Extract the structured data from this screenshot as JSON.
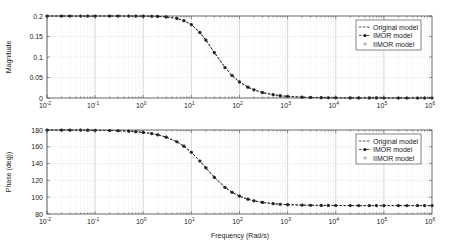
{
  "chart_data": [
    {
      "type": "line",
      "title": "",
      "xlabel": "",
      "ylabel": "Magnitude",
      "xscale": "log",
      "xlim": [
        0.01,
        1000000
      ],
      "ylim": [
        0,
        0.2
      ],
      "xticks": [
        0.01,
        0.1,
        1,
        10,
        100,
        1000,
        10000,
        100000,
        1000000
      ],
      "xtick_labels": [
        {
          "base": "10",
          "exp": "-2"
        },
        {
          "base": "10",
          "exp": "-1"
        },
        {
          "base": "10",
          "exp": "0"
        },
        {
          "base": "10",
          "exp": "1"
        },
        {
          "base": "10",
          "exp": "2"
        },
        {
          "base": "10",
          "exp": "3"
        },
        {
          "base": "10",
          "exp": "4"
        },
        {
          "base": "10",
          "exp": "5"
        },
        {
          "base": "10",
          "exp": "6"
        }
      ],
      "yticks": [
        0,
        0.05,
        0.1,
        0.15,
        0.2
      ],
      "ytick_labels": [
        "0",
        "0.05",
        "0.1",
        "0.15",
        "0.2"
      ],
      "grid": true,
      "legend_position": "top-right",
      "legend": [
        "Original model",
        "IMOR model",
        "IIMOR model"
      ],
      "x": [
        0.01,
        0.02,
        0.03,
        0.05,
        0.07,
        0.1,
        0.2,
        0.3,
        0.5,
        0.7,
        1,
        1.5,
        2,
        3,
        5,
        7,
        10,
        15,
        20,
        30,
        50,
        70,
        100,
        150,
        200,
        300,
        500,
        700,
        1000,
        2000,
        3000,
        5000,
        7000,
        10000,
        20000,
        30000,
        50000,
        70000,
        100000,
        200000,
        300000,
        500000,
        700000,
        1000000
      ],
      "series": [
        {
          "name": "Original model",
          "style": "dashed",
          "values": [
            0.2,
            0.2,
            0.2,
            0.2,
            0.2,
            0.2,
            0.2,
            0.2,
            0.2,
            0.2,
            0.1998,
            0.1994,
            0.199,
            0.1978,
            0.194,
            0.1887,
            0.1789,
            0.16,
            0.1414,
            0.1109,
            0.0743,
            0.0549,
            0.0392,
            0.0264,
            0.0199,
            0.0133,
            0.008,
            0.0057,
            0.004,
            0.002,
            0.0013,
            0.0008,
            0.0006,
            0.0004,
            0.0002,
            0.0001,
            0.0001,
            0.0001,
            0.0,
            0.0,
            0.0,
            0.0,
            0.0,
            0.0
          ]
        },
        {
          "name": "IMOR model",
          "style": "dashed-star",
          "values": [
            0.2,
            0.2,
            0.2,
            0.2,
            0.2,
            0.2,
            0.2,
            0.2,
            0.2,
            0.2,
            0.1998,
            0.1994,
            0.199,
            0.1978,
            0.194,
            0.1887,
            0.1789,
            0.16,
            0.1414,
            0.1109,
            0.0743,
            0.0549,
            0.0392,
            0.0264,
            0.0199,
            0.0133,
            0.008,
            0.0057,
            0.004,
            0.002,
            0.0013,
            0.0008,
            0.0006,
            0.0004,
            0.0002,
            0.0001,
            0.0001,
            0.0001,
            0.0,
            0.0,
            0.0,
            0.0,
            0.0,
            0.0
          ]
        },
        {
          "name": "IIMOR model",
          "style": "circle",
          "values": [
            0.2,
            0.2,
            0.2,
            0.2,
            0.2,
            0.2,
            0.2,
            0.2,
            0.2,
            0.2,
            0.1998,
            0.1994,
            0.199,
            0.1978,
            0.194,
            0.1887,
            0.1789,
            0.16,
            0.1414,
            0.1109,
            0.0743,
            0.0549,
            0.0392,
            0.0264,
            0.0199,
            0.0133,
            0.008,
            0.0057,
            0.004,
            0.002,
            0.0013,
            0.0008,
            0.0006,
            0.0004,
            0.0002,
            0.0001,
            0.0001,
            0.0001,
            0.0,
            0.0,
            0.0,
            0.0,
            0.0,
            0.0
          ]
        }
      ]
    },
    {
      "type": "line",
      "title": "",
      "xlabel": "Frequency (Rad/s)",
      "ylabel": "Phase (deg))",
      "xscale": "log",
      "xlim": [
        0.01,
        1000000
      ],
      "ylim": [
        80,
        180
      ],
      "xticks": [
        0.01,
        0.1,
        1,
        10,
        100,
        1000,
        10000,
        100000,
        1000000
      ],
      "xtick_labels": [
        {
          "base": "10",
          "exp": "-2"
        },
        {
          "base": "10",
          "exp": "-1"
        },
        {
          "base": "10",
          "exp": "0"
        },
        {
          "base": "10",
          "exp": "1"
        },
        {
          "base": "10",
          "exp": "2"
        },
        {
          "base": "10",
          "exp": "3"
        },
        {
          "base": "10",
          "exp": "4"
        },
        {
          "base": "10",
          "exp": "5"
        },
        {
          "base": "10",
          "exp": "6"
        }
      ],
      "yticks": [
        80,
        100,
        120,
        140,
        160,
        180
      ],
      "ytick_labels": [
        "80",
        "100",
        "120",
        "140",
        "160",
        "180"
      ],
      "grid": true,
      "legend_position": "top-right",
      "legend": [
        "Original model",
        "IMOR model",
        "IIMOR model"
      ],
      "x": [
        0.01,
        0.02,
        0.03,
        0.05,
        0.07,
        0.1,
        0.2,
        0.3,
        0.5,
        0.7,
        1,
        1.5,
        2,
        3,
        5,
        7,
        10,
        15,
        20,
        30,
        50,
        70,
        100,
        150,
        200,
        300,
        500,
        700,
        1000,
        2000,
        3000,
        5000,
        7000,
        10000,
        20000,
        30000,
        50000,
        70000,
        100000,
        200000,
        300000,
        500000,
        700000,
        1000000
      ],
      "series": [
        {
          "name": "Original model",
          "style": "dashed",
          "values": [
            180,
            179.9,
            179.9,
            179.9,
            179.8,
            179.7,
            179.4,
            179.1,
            178.6,
            178,
            177.1,
            175.7,
            174.3,
            171.5,
            166,
            160.7,
            153.4,
            143.1,
            135,
            123.7,
            111.8,
            105.9,
            101.3,
            97.6,
            95.7,
            93.8,
            92.3,
            91.6,
            91.1,
            90.6,
            90.4,
            90.2,
            90.2,
            90.1,
            90.1,
            90,
            90,
            90,
            90,
            90,
            90,
            90,
            90,
            90
          ]
        },
        {
          "name": "IMOR model",
          "style": "dashed-star",
          "values": [
            180,
            179.9,
            179.9,
            179.9,
            179.8,
            179.7,
            179.4,
            179.1,
            178.6,
            178,
            177.1,
            175.7,
            174.3,
            171.5,
            166,
            160.7,
            153.4,
            143.1,
            135,
            123.7,
            111.8,
            105.9,
            101.3,
            97.6,
            95.7,
            93.8,
            92.3,
            91.6,
            91.1,
            90.6,
            90.4,
            90.2,
            90.2,
            90.1,
            90.1,
            90,
            90,
            90,
            90,
            90,
            90,
            90,
            90,
            90
          ]
        },
        {
          "name": "IIMOR model",
          "style": "circle",
          "values": [
            180,
            179.9,
            179.9,
            179.9,
            179.8,
            179.7,
            179.4,
            179.1,
            178.6,
            178,
            177.1,
            175.7,
            174.3,
            171.5,
            166,
            160.7,
            153.4,
            143.1,
            135,
            123.7,
            111.8,
            105.9,
            101.3,
            97.6,
            95.7,
            93.8,
            92.3,
            91.6,
            91.1,
            90.6,
            90.4,
            90.2,
            90.2,
            90.1,
            90.1,
            90,
            90,
            90,
            90,
            90,
            90,
            90,
            90,
            90
          ]
        }
      ]
    }
  ]
}
